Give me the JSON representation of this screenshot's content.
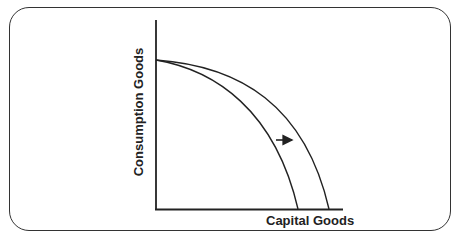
{
  "diagram": {
    "type": "production-possibilities-frontier-shift",
    "x_axis_label": "Capital Goods",
    "y_axis_label": "Consumption Goods",
    "curves": [
      {
        "name": "original-ppf",
        "description": "inner concave curve"
      },
      {
        "name": "shifted-ppf",
        "description": "outer concave curve"
      }
    ],
    "annotation": {
      "name": "shift-arrow",
      "direction": "right"
    },
    "line_color": "#222222"
  }
}
